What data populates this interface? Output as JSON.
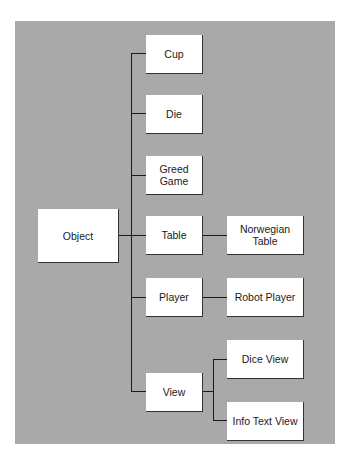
{
  "diagram": {
    "type": "class-hierarchy",
    "root": "Object",
    "nodes": {
      "object": "Object",
      "cup": "Cup",
      "die": "Die",
      "greed_game": "Greed\nGame",
      "table": "Table",
      "norwegian_table": "Norwegian\nTable",
      "player": "Player",
      "robot_player": "Robot Player",
      "view": "View",
      "dice_view": "Dice View",
      "info_text_view": "Info Text View"
    },
    "edges": [
      [
        "Object",
        "Cup"
      ],
      [
        "Object",
        "Die"
      ],
      [
        "Object",
        "Greed Game"
      ],
      [
        "Object",
        "Table"
      ],
      [
        "Object",
        "Player"
      ],
      [
        "Object",
        "View"
      ],
      [
        "Table",
        "Norwegian Table"
      ],
      [
        "Player",
        "Robot Player"
      ],
      [
        "View",
        "Dice View"
      ],
      [
        "View",
        "Info Text View"
      ]
    ],
    "colors": {
      "background": "#a9a9a9",
      "box": "#ffffff",
      "line": "#1a1a1a"
    }
  }
}
